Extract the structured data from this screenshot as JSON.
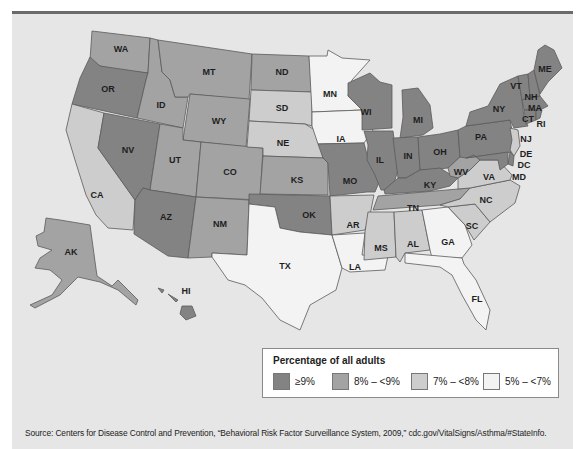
{
  "map": {
    "title": "Asthma prevalence among adults by state",
    "legend": {
      "title": "Percentage of all adults",
      "items": [
        {
          "label": "≥9%",
          "color": "#838383",
          "class": "c1"
        },
        {
          "label": "8% – <9%",
          "color": "#a3a3a3",
          "class": "c2"
        },
        {
          "label": "7% – <8%",
          "color": "#cdcdcd",
          "class": "c3"
        },
        {
          "label": "5% – <7%",
          "color": "#f3f3f3",
          "class": "c4"
        }
      ]
    },
    "states": {
      "WA": "8% – <9%",
      "OR": "≥9%",
      "CA": "7% – <8%",
      "NV": "≥9%",
      "ID": "8% – <9%",
      "MT": "8% – <9%",
      "WY": "8% – <9%",
      "UT": "8% – <9%",
      "CO": "8% – <9%",
      "AZ": "≥9%",
      "NM": "8% – <9%",
      "ND": "8% – <9%",
      "SD": "7% – <8%",
      "NE": "7% – <8%",
      "KS": "8% – <9%",
      "OK": "≥9%",
      "TX": "5% – <7%",
      "MN": "5% – <7%",
      "IA": "5% – <7%",
      "MO": "≥9%",
      "AR": "7% – <8%",
      "LA": "5% – <7%",
      "WI": "≥9%",
      "IL": "≥9%",
      "MI": "≥9%",
      "IN": "≥9%",
      "OH": "≥9%",
      "KY": "≥9%",
      "TN": "8% – <9%",
      "MS": "7% – <8%",
      "AL": "7% – <8%",
      "GA": "5% – <7%",
      "FL": "5% – <7%",
      "SC": "7% – <8%",
      "NC": "7% – <8%",
      "VA": "7% – <8%",
      "WV": "8% – <9%",
      "PA": "≥9%",
      "NY": "≥9%",
      "VT": "≥9%",
      "NH": "≥9%",
      "ME": "≥9%",
      "MA": "≥9%",
      "RI": "≥9%",
      "CT": "≥9%",
      "NJ": "7% – <8%",
      "DE": "≥9%",
      "MD": "≥9%",
      "DC": "≥9%",
      "AK": "8% – <9%",
      "HI": "≥9%"
    },
    "labels": {
      "WA": "WA",
      "OR": "OR",
      "CA": "CA",
      "NV": "NV",
      "ID": "ID",
      "MT": "MT",
      "WY": "WY",
      "UT": "UT",
      "CO": "CO",
      "AZ": "AZ",
      "NM": "NM",
      "ND": "ND",
      "SD": "SD",
      "NE": "NE",
      "KS": "KS",
      "OK": "OK",
      "TX": "TX",
      "MN": "MN",
      "IA": "IA",
      "MO": "MO",
      "AR": "AR",
      "LA": "LA",
      "WI": "WI",
      "IL": "IL",
      "MI": "MI",
      "IN": "IN",
      "OH": "OH",
      "KY": "KY",
      "TN": "TN",
      "MS": "MS",
      "AL": "AL",
      "GA": "GA",
      "FL": "FL",
      "SC": "SC",
      "NC": "NC",
      "VA": "VA",
      "WV": "WV",
      "PA": "PA",
      "NY": "NY",
      "VT": "VT",
      "NH": "NH",
      "ME": "ME",
      "MA": "MA",
      "RI": "RI",
      "CT": "CT",
      "NJ": "NJ",
      "DE": "DE",
      "MD": "MD",
      "DC": "DC",
      "AK": "AK",
      "HI": "HI"
    }
  },
  "source": "Source: Centers for Disease Control and Prevention, “Behavioral Risk Factor Surveillance System, 2009,” cdc.gov/VitalSigns/Asthma/#StateInfo."
}
